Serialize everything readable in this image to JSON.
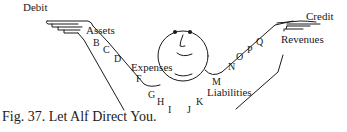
{
  "diagram": {
    "labels": {
      "debit": "Debit",
      "credit": "Credit",
      "assets": "Assets",
      "expenses": "Expenses",
      "revenues": "Revenues",
      "liabilities": "Liabilities"
    },
    "left_arm_letters": [
      "B",
      "C",
      "D",
      "F",
      "G",
      "H",
      "I"
    ],
    "right_arm_letters": [
      "J",
      "K",
      "M",
      "N",
      "O",
      "P",
      "Q"
    ],
    "figure": "smiling-face",
    "caption": "Fig. 37. Let Alf Direct You.",
    "colors": {
      "ink": "#1a1a1a",
      "background": "#ffffff"
    }
  }
}
